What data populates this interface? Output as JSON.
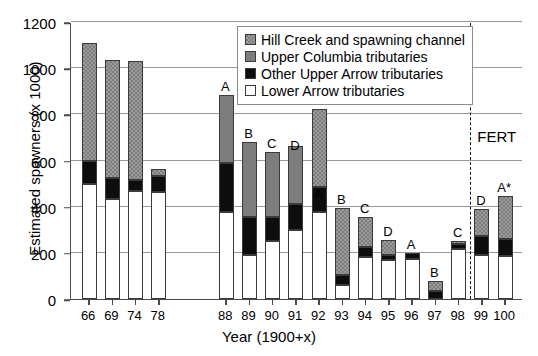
{
  "chart_data": {
    "type": "bar",
    "stacked": true,
    "title": "",
    "xlabel": "Year (1900+x)",
    "ylabel": "Estimated spawners (x 1000)",
    "ylim": [
      0,
      1200
    ],
    "yticks": [
      0,
      200,
      400,
      600,
      800,
      1000,
      1200
    ],
    "grid": true,
    "legend_position": "top-right",
    "categories": [
      "66",
      "69",
      "74",
      "78",
      "88",
      "89",
      "90",
      "91",
      "92",
      "93",
      "94",
      "95",
      "96",
      "97",
      "98",
      "99",
      "100"
    ],
    "category_gap_after": "78",
    "series": [
      {
        "name": "Lower Arrow tributaries",
        "color": "#ffffff",
        "values": [
          500,
          435,
          470,
          465,
          375,
          190,
          250,
          300,
          375,
          60,
          180,
          170,
          175,
          0,
          215,
          190,
          185
        ]
      },
      {
        "name": "Other Upper Arrow tributaries",
        "color": "#0d0d0d",
        "values": [
          100,
          90,
          45,
          70,
          215,
          165,
          105,
          110,
          110,
          45,
          45,
          20,
          25,
          35,
          25,
          85,
          75
        ]
      },
      {
        "name": "Upper Columbia tributaries",
        "color": "#7d7d7d",
        "values": [
          0,
          0,
          0,
          0,
          295,
          325,
          280,
          255,
          0,
          0,
          0,
          0,
          0,
          0,
          0,
          0,
          0
        ]
      },
      {
        "name": "Hill Creek and spawning channel",
        "color": "#7d7d7d",
        "values": [
          510,
          510,
          515,
          30,
          0,
          0,
          0,
          0,
          340,
          290,
          130,
          65,
          0,
          45,
          10,
          115,
          185
        ]
      }
    ],
    "totals": [
      1110,
      1035,
      1030,
      565,
      885,
      680,
      635,
      630,
      415,
      395,
      355,
      255,
      200,
      80,
      250,
      390,
      445
    ],
    "bar_notes": [
      "",
      "",
      "",
      "",
      "A",
      "B",
      "C",
      "D",
      "A",
      "B",
      "C",
      "D",
      "A",
      "B",
      "C",
      "D",
      "A*"
    ],
    "annotations": [
      {
        "name": "fert-divider",
        "label": "FERT",
        "after_category": "98"
      }
    ]
  },
  "legend": {
    "entries": [
      {
        "label": "Hill Creek and spawning channel",
        "swatch": "hatched-gray-swatch"
      },
      {
        "label": "Upper Columbia tributaries",
        "swatch": "gray-swatch"
      },
      {
        "label": "Other Upper Arrow tributaries",
        "swatch": "black-swatch"
      },
      {
        "label": "Lower Arrow tributaries",
        "swatch": "white-swatch"
      }
    ]
  }
}
